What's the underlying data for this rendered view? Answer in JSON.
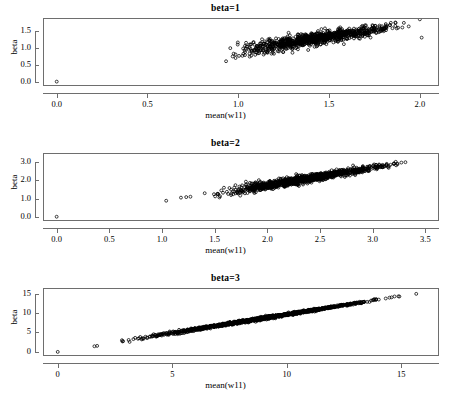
{
  "figure": {
    "width": 451,
    "height": 407,
    "background": "#ffffff",
    "axis_color": "#6e6e6e",
    "point_color": "#000000",
    "marker": "open-circle"
  },
  "chart_data": [
    {
      "type": "scatter",
      "title": "beta=1",
      "xlabel": "mean(w11)",
      "ylabel": "beta",
      "xlim": [
        -0.07,
        2.1
      ],
      "ylim": [
        -0.1,
        1.85
      ],
      "xticks": [
        0.0,
        0.5,
        1.0,
        1.5,
        2.0
      ],
      "xticklabels": [
        "0.0",
        "0.5",
        "1.0",
        "1.5",
        "2.0"
      ],
      "yticks": [
        0.0,
        0.5,
        1.0,
        1.5
      ],
      "yticklabels": [
        "0.0",
        "0.5",
        "1.0",
        "1.5"
      ],
      "grid": false,
      "legend": null,
      "n_points": 900,
      "cloud": {
        "x_min": 0.84,
        "x_max": 2.02,
        "slope": 0.82,
        "intercept": 0.1,
        "scatter_sd": 0.095,
        "outliers": [
          [
            0.0,
            0.0
          ],
          [
            2.0,
            1.84
          ],
          [
            2.01,
            1.3
          ]
        ]
      }
    },
    {
      "type": "scatter",
      "title": "beta=2",
      "xlabel": "mean(w11)",
      "ylabel": "beta",
      "xlim": [
        -0.12,
        3.62
      ],
      "ylim": [
        -0.18,
        3.45
      ],
      "xticks": [
        0.0,
        0.5,
        1.0,
        1.5,
        2.0,
        2.5,
        3.0,
        3.5
      ],
      "xticklabels": [
        "0.0",
        "0.5",
        "1.0",
        "1.5",
        "2.0",
        "2.5",
        "3.0",
        "3.5"
      ],
      "yticks": [
        0.0,
        1.0,
        2.0,
        3.0
      ],
      "yticklabels": [
        "0.0",
        "1.0",
        "2.0",
        "3.0"
      ],
      "grid": false,
      "legend": null,
      "n_points": 1100,
      "cloud": {
        "x_min": 1.33,
        "x_max": 3.4,
        "slope": 0.97,
        "intercept": -0.22,
        "scatter_sd": 0.105,
        "outliers": [
          [
            0.0,
            0.0
          ],
          [
            1.04,
            0.88
          ],
          [
            1.18,
            1.05
          ],
          [
            1.23,
            1.08
          ],
          [
            1.27,
            1.1
          ]
        ]
      }
    },
    {
      "type": "scatter",
      "title": "beta=3",
      "xlabel": "mean(w11)",
      "ylabel": "beta",
      "xlim": [
        -0.6,
        16.6
      ],
      "ylim": [
        -0.8,
        16.2
      ],
      "xticks": [
        0,
        5,
        10,
        15
      ],
      "xticklabels": [
        "0",
        "5",
        "10",
        "15"
      ],
      "yticks": [
        0,
        5,
        10,
        15
      ],
      "yticklabels": [
        "0",
        "5",
        "10",
        "15"
      ],
      "grid": false,
      "legend": null,
      "n_points": 1300,
      "cloud": {
        "x_min": 1.7,
        "x_max": 15.7,
        "slope": 0.955,
        "intercept": 0.1,
        "scatter_sd": 0.16,
        "outliers": [
          [
            0.0,
            0.0
          ],
          [
            1.6,
            1.45
          ],
          [
            1.72,
            1.55
          ],
          [
            15.65,
            14.95
          ]
        ]
      }
    }
  ]
}
